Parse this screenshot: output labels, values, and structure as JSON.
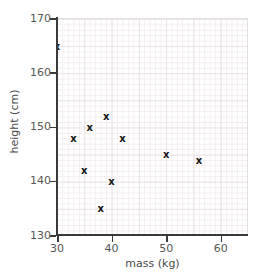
{
  "chart_data": {
    "type": "scatter",
    "title": "",
    "xlabel": "mass (kg)",
    "ylabel": "height (cm)",
    "xlim": [
      30,
      65
    ],
    "ylim": [
      130,
      170
    ],
    "xticks": [
      30,
      40,
      50,
      60
    ],
    "yticks": [
      130,
      140,
      150,
      160,
      170
    ],
    "grid": true,
    "grid_minor_step": {
      "x": 1,
      "y": 1
    },
    "grid_major_step": {
      "x": 5,
      "y": 5
    },
    "legend": null,
    "marker": "x",
    "marker_color": "#141414",
    "points": [
      {
        "x": 30,
        "y": 165
      },
      {
        "x": 33,
        "y": 148
      },
      {
        "x": 35,
        "y": 142
      },
      {
        "x": 36,
        "y": 150
      },
      {
        "x": 38,
        "y": 135
      },
      {
        "x": 39,
        "y": 152
      },
      {
        "x": 40,
        "y": 140
      },
      {
        "x": 42,
        "y": 148
      },
      {
        "x": 50,
        "y": 145
      },
      {
        "x": 56,
        "y": 144
      }
    ],
    "x_values": [
      30,
      33,
      35,
      36,
      38,
      39,
      40,
      42,
      50,
      56
    ],
    "y_values": [
      165,
      148,
      142,
      150,
      135,
      152,
      140,
      148,
      145,
      144
    ]
  },
  "axes": {
    "x_tick_labels": [
      "30",
      "40",
      "50",
      "60"
    ],
    "y_tick_labels": [
      "130",
      "140",
      "150",
      "160",
      "170"
    ],
    "x_title": "mass (kg)",
    "y_title": "height (cm)"
  },
  "marker_glyph": "x"
}
